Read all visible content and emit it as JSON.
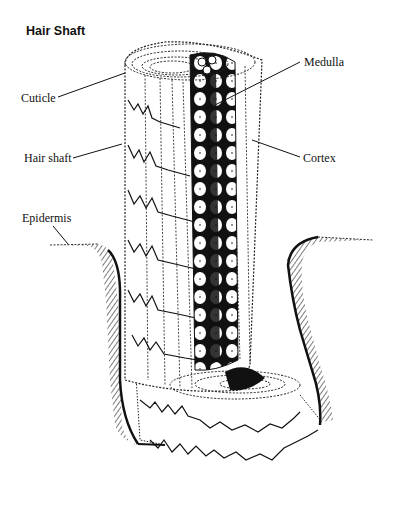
{
  "figure": {
    "title": "Hair Shaft",
    "labels": {
      "cuticle": "Cuticle",
      "hair_shaft": "Hair shaft",
      "epidermis": "Epidermis",
      "medulla": "Medulla",
      "cortex": "Cortex"
    },
    "colors": {
      "ink": "#111111",
      "background": "#ffffff"
    }
  }
}
